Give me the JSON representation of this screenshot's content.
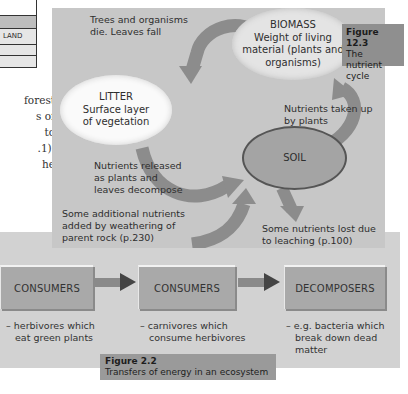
{
  "table_fragment": {
    "rows": [
      "",
      "LAND",
      "",
      ""
    ]
  },
  "body_text_fragment": [
    "forest",
    "s of",
    "to",
    ".1).",
    "he"
  ],
  "figure_12_3": {
    "caption_number": "Figure 12.3",
    "caption_title": "The nutrient cycle",
    "caption_title_lines": [
      "The nutrient",
      "cycle"
    ],
    "nodes": {
      "biomass": {
        "title": "BIOMASS",
        "lines": [
          "Weight of living",
          "material (plants and",
          "organisms)"
        ]
      },
      "litter": {
        "title": "LITTER",
        "lines": [
          "Surface layer",
          "of vegetation"
        ]
      },
      "soil": {
        "title": "SOIL"
      }
    },
    "flows": {
      "biomass_to_litter": [
        "Trees and organisms",
        "die. Leaves fall"
      ],
      "litter_to_soil": [
        "Nutrients released",
        "as plants and",
        "leaves decompose"
      ],
      "soil_to_biomass": [
        "Nutrients taken up",
        "by plants"
      ],
      "rock_to_soil": [
        "Some additional nutrients",
        "added by weathering of",
        "parent rock (p.230)"
      ],
      "soil_loss": [
        "Some nutrients lost due",
        "to leaching (p.100)"
      ]
    }
  },
  "figure_2_2": {
    "caption_number": "Figure 2.2",
    "caption_title": "Transfers of energy in an ecosystem",
    "boxes": [
      {
        "label": "CONSUMERS",
        "desc": [
          "– herbivores which",
          "eat green plants"
        ]
      },
      {
        "label": "CONSUMERS",
        "desc": [
          "– carnivores which",
          "consume herbivores"
        ]
      },
      {
        "label": "DECOMPOSERS",
        "desc": [
          "– e.g. bacteria which",
          "break down dead",
          "matter"
        ]
      }
    ]
  },
  "colors": {
    "panel_upper": "#c7c7c7",
    "panel_lower": "#d2d2d2",
    "box": "#a9a9a9",
    "caption": "#8f8f8f",
    "arrow": "#8a8a8a",
    "soil_border": "#555555"
  }
}
